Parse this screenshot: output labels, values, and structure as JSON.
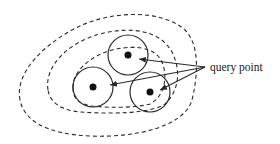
{
  "diagram": {
    "label": "query point",
    "colors": {
      "stroke": "#2a2a2a",
      "dot": "#111111",
      "background": "#ffffff"
    },
    "contours": [
      {
        "name": "outer",
        "style": "dashed"
      },
      {
        "name": "middle",
        "style": "dashed"
      },
      {
        "name": "inner",
        "style": "dashed"
      }
    ],
    "clusters": [
      {
        "name": "top",
        "cx": 128,
        "cy": 55,
        "r": 20
      },
      {
        "name": "left",
        "cx": 93,
        "cy": 87,
        "r": 20
      },
      {
        "name": "right",
        "cx": 150,
        "cy": 92,
        "r": 20
      }
    ],
    "arrows": [
      {
        "from": [
          205,
          67
        ],
        "to": [
          139,
          59
        ]
      },
      {
        "from": [
          205,
          67
        ],
        "to": [
          110,
          85
        ]
      },
      {
        "from": [
          205,
          67
        ],
        "to": [
          160,
          90
        ]
      }
    ]
  }
}
